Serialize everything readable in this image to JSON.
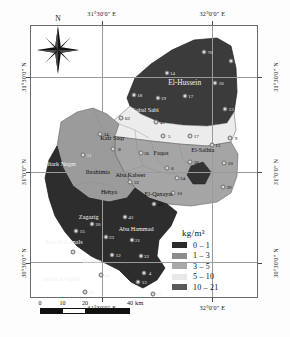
{
  "figure": {
    "kind": "thematic-choropleth-map",
    "region_title": "Sharqia Governorate"
  },
  "axes": {
    "top": [
      {
        "label": "31°30'0\" E",
        "x_pct": 31.5
      },
      {
        "label": "32°0'0\" E",
        "x_pct": 80.0
      }
    ],
    "bottom": [
      {
        "label": "31°30'0\" E",
        "x_pct": 31.5
      },
      {
        "label": "32°0'0\" E",
        "x_pct": 80.0
      }
    ],
    "left": [
      {
        "label": "31°30'0\" N",
        "y_pct": 19.0
      },
      {
        "label": "31°0'0\" N",
        "y_pct": 54.0
      },
      {
        "label": "30°30'0\" N",
        "y_pct": 87.0
      }
    ],
    "right": [
      {
        "label": "31°30'0\" N",
        "y_pct": 19.0
      },
      {
        "label": "31°0'0\" N",
        "y_pct": 54.0
      },
      {
        "label": "30°30'0\" N",
        "y_pct": 87.0
      }
    ]
  },
  "compass": {
    "north_label": "N"
  },
  "legend": {
    "title": "kg/m³",
    "classes": [
      {
        "label": "0 – 1",
        "color": "#2b2b2b"
      },
      {
        "label": "1 – 3",
        "color": "#8d8d8d"
      },
      {
        "label": "3 – 5",
        "color": "#a9a9a9"
      },
      {
        "label": "5 – 10",
        "color": "#e8e8e8"
      },
      {
        "label": "10 – 21",
        "color": "#5a5a5a"
      }
    ]
  },
  "scalebar": {
    "unit": "km",
    "ticks": [
      "0",
      "10",
      "20",
      "40"
    ]
  },
  "places": [
    {
      "name": "El-Hussein",
      "x_pct": 68.0,
      "y_pct": 20.5,
      "tone": "light",
      "size": "big"
    },
    {
      "name": "Gabal Sabi",
      "x_pct": 50.5,
      "y_pct": 30.5,
      "tone": "light",
      "size": "sm"
    },
    {
      "name": "Kafr Saqr",
      "x_pct": 36.0,
      "y_pct": 41.0,
      "tone": "dark",
      "size": "sm"
    },
    {
      "name": "El-Salhia",
      "x_pct": 76.0,
      "y_pct": 45.5,
      "tone": "dark",
      "size": "sm"
    },
    {
      "name": "Faqos",
      "x_pct": 57.5,
      "y_pct": 46.5,
      "tone": "dark",
      "size": "sm"
    },
    {
      "name": "Diark Negm",
      "x_pct": 13.0,
      "y_pct": 50.5,
      "tone": "light",
      "size": "sm"
    },
    {
      "name": "Ibrahimia",
      "x_pct": 29.5,
      "y_pct": 53.5,
      "tone": "dark",
      "size": "sm"
    },
    {
      "name": "Abu Kabeer",
      "x_pct": 44.0,
      "y_pct": 54.5,
      "tone": "dark",
      "size": "sm"
    },
    {
      "name": "Hehya",
      "x_pct": 34.5,
      "y_pct": 61.0,
      "tone": "dark",
      "size": "sm"
    },
    {
      "name": "El-Qanayat",
      "x_pct": 56.5,
      "y_pct": 61.5,
      "tone": "dark",
      "size": "sm"
    },
    {
      "name": "Zagazig",
      "x_pct": 25.5,
      "y_pct": 70.0,
      "tone": "light",
      "size": "sm"
    },
    {
      "name": "Abu Hammad",
      "x_pct": 46.5,
      "y_pct": 74.5,
      "tone": "light",
      "size": "sm"
    },
    {
      "name": "Bles el-Kamals",
      "x_pct": 14.5,
      "y_pct": 79.5,
      "tone": "light",
      "size": "sm"
    },
    {
      "name": "Belbais",
      "x_pct": 27.0,
      "y_pct": 86.5,
      "tone": "light",
      "size": "sm"
    },
    {
      "name": "Minia El-Qmh",
      "x_pct": 13.5,
      "y_pct": 93.0,
      "tone": "light",
      "size": "sm"
    },
    {
      "name": "Tenth of Ramadan",
      "x_pct": 40.0,
      "y_pct": 100.0,
      "tone": "light",
      "size": "sm"
    }
  ],
  "samples": [
    {
      "n": "70",
      "x_pct": 76.5,
      "y_pct": 9.5,
      "tone": "light"
    },
    {
      "n": "21",
      "x_pct": 88.5,
      "y_pct": 13.0,
      "tone": "light"
    },
    {
      "n": "14",
      "x_pct": 60.0,
      "y_pct": 17.5,
      "tone": "light"
    },
    {
      "n": "16",
      "x_pct": 81.5,
      "y_pct": 21.0,
      "tone": "light"
    },
    {
      "n": "18",
      "x_pct": 45.5,
      "y_pct": 25.5,
      "tone": "light"
    },
    {
      "n": "19",
      "x_pct": 56.0,
      "y_pct": 26.5,
      "tone": "light"
    },
    {
      "n": "17",
      "x_pct": 68.0,
      "y_pct": 26.0,
      "tone": "light"
    },
    {
      "n": "13",
      "x_pct": 86.0,
      "y_pct": 30.5,
      "tone": "light"
    },
    {
      "n": "62",
      "x_pct": 40.0,
      "y_pct": 34.0,
      "tone": "dark"
    },
    {
      "n": "41",
      "x_pct": 55.5,
      "y_pct": 35.5,
      "tone": "dark"
    },
    {
      "n": "17",
      "x_pct": 70.5,
      "y_pct": 40.5,
      "tone": "dark"
    },
    {
      "n": "5",
      "x_pct": 58.5,
      "y_pct": 40.5,
      "tone": "dark"
    },
    {
      "n": "9",
      "x_pct": 88.0,
      "y_pct": 41.5,
      "tone": "dark"
    },
    {
      "n": "34",
      "x_pct": 30.5,
      "y_pct": 40.0,
      "tone": "dark"
    },
    {
      "n": "15",
      "x_pct": 80.0,
      "y_pct": 44.0,
      "tone": "dark"
    },
    {
      "n": "8",
      "x_pct": 36.5,
      "y_pct": 45.5,
      "tone": "dark"
    },
    {
      "n": "36",
      "x_pct": 48.5,
      "y_pct": 47.0,
      "tone": "dark"
    },
    {
      "n": "31",
      "x_pct": 23.0,
      "y_pct": 47.5,
      "tone": "light"
    },
    {
      "n": "38",
      "x_pct": 70.5,
      "y_pct": 50.0,
      "tone": "dark"
    },
    {
      "n": "10",
      "x_pct": 85.5,
      "y_pct": 50.5,
      "tone": "dark"
    },
    {
      "n": "6",
      "x_pct": 60.0,
      "y_pct": 52.5,
      "tone": "dark"
    },
    {
      "n": "32",
      "x_pct": 44.0,
      "y_pct": 57.5,
      "tone": "dark"
    },
    {
      "n": "24",
      "x_pct": 64.5,
      "y_pct": 56.0,
      "tone": "dark"
    },
    {
      "n": "39",
      "x_pct": 85.0,
      "y_pct": 59.5,
      "tone": "dark"
    },
    {
      "n": "10",
      "x_pct": 63.0,
      "y_pct": 61.5,
      "tone": "dark"
    },
    {
      "n": "40",
      "x_pct": 54.5,
      "y_pct": 65.5,
      "tone": "dark"
    },
    {
      "n": "20",
      "x_pct": 27.0,
      "y_pct": 73.0,
      "tone": "light"
    },
    {
      "n": "43",
      "x_pct": 41.5,
      "y_pct": 70.5,
      "tone": "light"
    },
    {
      "n": "15",
      "x_pct": 20.0,
      "y_pct": 75.5,
      "tone": "light"
    },
    {
      "n": "21",
      "x_pct": 44.5,
      "y_pct": 79.0,
      "tone": "light"
    },
    {
      "n": "23",
      "x_pct": 33.0,
      "y_pct": 78.0,
      "tone": "light"
    },
    {
      "n": "25",
      "x_pct": 18.5,
      "y_pct": 83.5,
      "tone": "light"
    },
    {
      "n": "12",
      "x_pct": 36.0,
      "y_pct": 84.5,
      "tone": "light"
    },
    {
      "n": "22",
      "x_pct": 48.5,
      "y_pct": 85.0,
      "tone": "light"
    },
    {
      "n": "4",
      "x_pct": 50.0,
      "y_pct": 91.0,
      "tone": "light"
    },
    {
      "n": "44",
      "x_pct": 31.0,
      "y_pct": 92.0,
      "tone": "light"
    },
    {
      "n": "13",
      "x_pct": 47.5,
      "y_pct": 94.5,
      "tone": "light"
    },
    {
      "n": "29",
      "x_pct": 24.0,
      "y_pct": 98.0,
      "tone": "light"
    },
    {
      "n": "31",
      "x_pct": 42.0,
      "y_pct": 101.5,
      "tone": "light"
    },
    {
      "n": "27",
      "x_pct": 54.0,
      "y_pct": 99.0,
      "tone": "light"
    },
    {
      "n": "17",
      "x_pct": 55.0,
      "y_pct": 104.0,
      "tone": "light"
    },
    {
      "n": "19",
      "x_pct": 44.5,
      "y_pct": 108.0,
      "tone": "light"
    },
    {
      "n": "46",
      "x_pct": 27.0,
      "y_pct": 112.0,
      "tone": "dark"
    }
  ]
}
